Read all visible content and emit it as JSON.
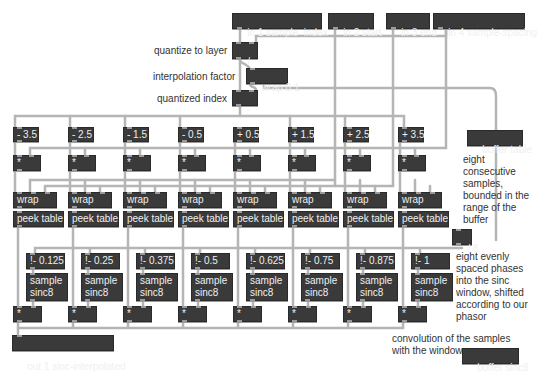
{
  "inlets": [
    {
      "label": "in 1 sample_index"
    },
    {
      "label": "in 2 start"
    },
    {
      "label": "in 3 end"
    },
    {
      "label": "in 4 sample-spacing"
    }
  ],
  "top_chain": {
    "divide": "/",
    "wrap": "wrap 0 1",
    "subtract": "-"
  },
  "comments": {
    "quantize": "quantize to layer",
    "interp": "interpolation factor",
    "qindex": "quantized index",
    "eight_samples": "eight\nconsecutive\nsamples,\nbounded in the\nrange of the\nbuffer",
    "eight_phases": "eight evenly\nspaced phases\ninto the sinc\nwindow, shifted\naccording to our\nphasor",
    "convolution": "convolution of the samples\nwith the window"
  },
  "columns": [
    {
      "offset": "- 3.5",
      "mul": "*",
      "wrap": "wrap",
      "peek": "peek table",
      "phase": "!- 0.125",
      "sample": "sample\nsinc8",
      "mul2": "*"
    },
    {
      "offset": "- 2.5",
      "mul": "*",
      "wrap": "wrap",
      "peek": "peek table",
      "phase": "!- 0.25",
      "sample": "sample\nsinc8",
      "mul2": "*"
    },
    {
      "offset": "- 1.5",
      "mul": "*",
      "wrap": "wrap",
      "peek": "peek table",
      "phase": "!- 0.375",
      "sample": "sample\nsinc8",
      "mul2": "*"
    },
    {
      "offset": "- 0.5",
      "mul": "*",
      "wrap": "wrap",
      "peek": "peek table",
      "phase": "!- 0.5",
      "sample": "sample\nsinc8",
      "mul2": "*"
    },
    {
      "offset": "+ 0.5",
      "mul": "*",
      "wrap": "wrap",
      "peek": "peek table",
      "phase": "!- 0.625",
      "sample": "sample\nsinc8",
      "mul2": "*"
    },
    {
      "offset": "+ 1.5",
      "mul": "*",
      "wrap": "wrap",
      "peek": "peek table",
      "phase": "!- 0.75",
      "sample": "sample\nsinc8",
      "mul2": "*"
    },
    {
      "offset": "+ 2.5",
      "mul": "*",
      "wrap": "wrap",
      "peek": "peek table",
      "phase": "!- 0.875",
      "sample": "sample\nsinc8",
      "mul2": "*"
    },
    {
      "offset": "+ 3.5",
      "mul": "*",
      "wrap": "wrap",
      "peek": "peek table",
      "phase": "!- 1",
      "sample": "sample\nsinc8",
      "mul2": "*"
    }
  ],
  "side": {
    "buffer_table": "buffer table",
    "div8": "/ 8",
    "buffer_sinc8": "buffer sinc8"
  },
  "outlet": {
    "label": "out 1 sinc-interpolated"
  },
  "colors": {
    "object_bg": "#3a3a3a",
    "object_text": "#f0f0f0",
    "wire": "#b0b0b0",
    "comment": "#333333"
  }
}
